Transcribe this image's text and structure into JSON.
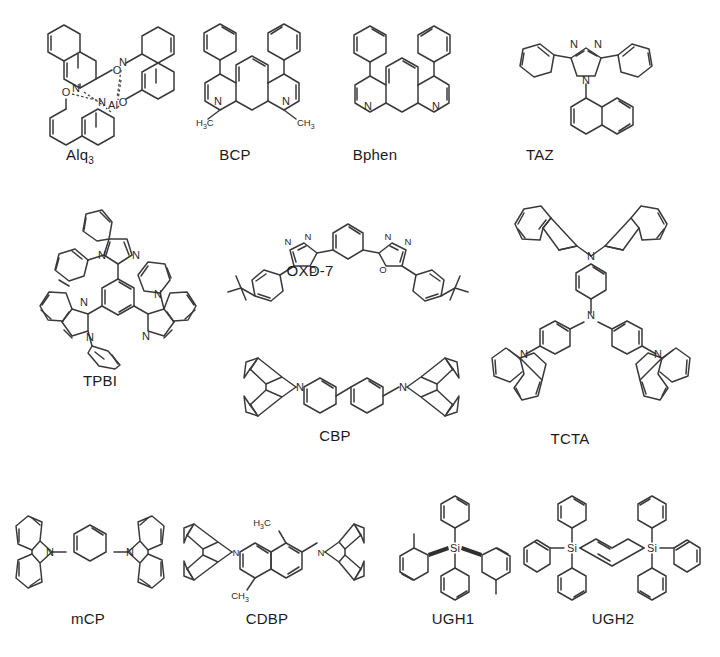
{
  "figure": {
    "type": "chemical-structure-panel",
    "background_color": "#ffffff",
    "line_color": "#3a3a3a",
    "text_color": "#1b1b1b",
    "rows": 3,
    "molecule_count": 12
  },
  "molecules": [
    {
      "id": "alq3",
      "label": "Alq",
      "label_sub": "3",
      "full_name": "Alq3",
      "row": 1,
      "atoms_shown": [
        "Al",
        "N",
        "N",
        "N",
        "O",
        "O",
        "O"
      ],
      "caption_x": 60,
      "caption_y": 146
    },
    {
      "id": "bcp",
      "label": "BCP",
      "label_sub": "",
      "full_name": "BCP",
      "row": 1,
      "atoms_shown": [
        "N",
        "N",
        "H3C",
        "CH3"
      ],
      "caption_x": 205,
      "caption_y": 146
    },
    {
      "id": "bphen",
      "label": "Bphen",
      "label_sub": "",
      "full_name": "Bphen",
      "row": 1,
      "atoms_shown": [
        "N",
        "N"
      ],
      "caption_x": 350,
      "caption_y": 146
    },
    {
      "id": "taz",
      "label": "TAZ",
      "label_sub": "",
      "full_name": "TAZ",
      "row": 1,
      "atoms_shown": [
        "N",
        "N",
        "N"
      ],
      "caption_x": 520,
      "caption_y": 146
    },
    {
      "id": "tpbi",
      "label": "TPBI",
      "label_sub": "",
      "full_name": "TPBI",
      "row": 2,
      "atoms_shown": [
        "N",
        "N",
        "N",
        "N",
        "N",
        "N"
      ],
      "caption_x": 85,
      "caption_y": 372
    },
    {
      "id": "oxd7",
      "label": "OXD-7",
      "label_sub": "",
      "full_name": "OXD-7",
      "row": 2,
      "atoms_shown": [
        "N",
        "N",
        "O",
        "N",
        "N",
        "O"
      ],
      "caption_x": 305,
      "caption_y": 263
    },
    {
      "id": "tcta",
      "label": "TCTA",
      "label_sub": "",
      "full_name": "TCTA",
      "row": 2,
      "atoms_shown": [
        "N",
        "N",
        "N",
        "N"
      ],
      "caption_x": 555,
      "caption_y": 432
    },
    {
      "id": "cbp",
      "label": "CBP",
      "label_sub": "",
      "full_name": "CBP",
      "row": 2,
      "atoms_shown": [
        "N",
        "N"
      ],
      "caption_x": 322,
      "caption_y": 428
    },
    {
      "id": "mcp",
      "label": "mCP",
      "label_sub": "",
      "full_name": "mCP",
      "row": 3,
      "atoms_shown": [
        "N",
        "N"
      ],
      "caption_x": 63,
      "caption_y": 612
    },
    {
      "id": "cdbp",
      "label": "CDBP",
      "label_sub": "",
      "full_name": "CDBP",
      "row": 3,
      "atoms_shown": [
        "N",
        "N",
        "H3C",
        "CH3"
      ],
      "caption_x": 240,
      "caption_y": 612
    },
    {
      "id": "ugh1",
      "label": "UGH1",
      "label_sub": "",
      "full_name": "UGH1",
      "row": 3,
      "atoms_shown": [
        "Si"
      ],
      "caption_x": 425,
      "caption_y": 612
    },
    {
      "id": "ugh2",
      "label": "UGH2",
      "label_sub": "",
      "full_name": "UGH2",
      "row": 3,
      "atoms_shown": [
        "Si",
        "Si"
      ],
      "caption_x": 588,
      "caption_y": 612
    }
  ],
  "atom_labels": {
    "aluminium": "Al",
    "nitrogen": "N",
    "oxygen": "O",
    "silicon": "Si",
    "methyl_left": "H",
    "methyl_left_tail": "C",
    "methyl_right": "CH",
    "methyl_sub": "3"
  }
}
